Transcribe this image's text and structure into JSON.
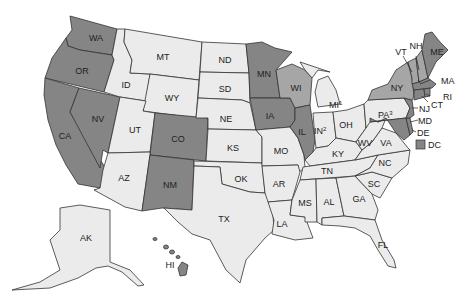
{
  "map": {
    "type": "US states choropleth",
    "colors": {
      "none": "#ebebeb",
      "dark": "#858585",
      "medium": "#a6a6a6",
      "border": "#333333",
      "background": "#ffffff"
    },
    "legend": {
      "dc_label": "DC",
      "dc_category": "dark"
    },
    "states": {
      "WA": {
        "label": "WA",
        "category": "dark"
      },
      "OR": {
        "label": "OR",
        "category": "dark"
      },
      "CA": {
        "label": "CA",
        "category": "dark"
      },
      "NV": {
        "label": "NV",
        "category": "dark"
      },
      "ID": {
        "label": "ID",
        "category": "none"
      },
      "MT": {
        "label": "MT",
        "category": "none"
      },
      "WY": {
        "label": "WY",
        "category": "none"
      },
      "UT": {
        "label": "UT",
        "category": "none"
      },
      "AZ": {
        "label": "AZ",
        "category": "none"
      },
      "CO": {
        "label": "CO",
        "category": "dark"
      },
      "NM": {
        "label": "NM",
        "category": "dark"
      },
      "ND": {
        "label": "ND",
        "category": "none"
      },
      "SD": {
        "label": "SD",
        "category": "none"
      },
      "NE": {
        "label": "NE",
        "category": "none"
      },
      "KS": {
        "label": "KS",
        "category": "none"
      },
      "OK": {
        "label": "OK",
        "category": "none"
      },
      "TX": {
        "label": "TX",
        "category": "none"
      },
      "MN": {
        "label": "MN",
        "category": "dark"
      },
      "IA": {
        "label": "IA",
        "category": "dark"
      },
      "MO": {
        "label": "MO",
        "category": "none"
      },
      "AR": {
        "label": "AR",
        "category": "none"
      },
      "LA": {
        "label": "LA",
        "category": "none"
      },
      "WI": {
        "label": "WI",
        "category": "medium"
      },
      "IL": {
        "label": "IL",
        "category": "dark"
      },
      "MI": {
        "label": "MI",
        "sup": "1",
        "category": "none"
      },
      "IN": {
        "label": "IN",
        "sup": "2",
        "category": "none"
      },
      "OH": {
        "label": "OH",
        "category": "none"
      },
      "KY": {
        "label": "KY",
        "category": "none"
      },
      "TN": {
        "label": "TN",
        "category": "none"
      },
      "MS": {
        "label": "MS",
        "category": "none"
      },
      "AL": {
        "label": "AL",
        "category": "none"
      },
      "GA": {
        "label": "GA",
        "category": "none"
      },
      "FL": {
        "label": "FL",
        "category": "none"
      },
      "SC": {
        "label": "SC",
        "category": "none"
      },
      "NC": {
        "label": "NC",
        "category": "none"
      },
      "VA": {
        "label": "VA",
        "category": "none"
      },
      "WV": {
        "label": "WV",
        "category": "none"
      },
      "PA": {
        "label": "PA",
        "sup": "3",
        "category": "none"
      },
      "NY": {
        "label": "NY",
        "category": "medium"
      },
      "VT": {
        "label": "VT",
        "category": "medium"
      },
      "NH": {
        "label": "NH",
        "category": "medium"
      },
      "ME": {
        "label": "ME",
        "category": "dark"
      },
      "MA": {
        "label": "MA",
        "category": "dark"
      },
      "RI": {
        "label": "RI",
        "category": "dark"
      },
      "CT": {
        "label": "CT",
        "category": "dark"
      },
      "NJ": {
        "label": "NJ",
        "category": "dark"
      },
      "DE": {
        "label": "DE",
        "category": "dark"
      },
      "MD": {
        "label": "MD",
        "category": "dark"
      },
      "AK": {
        "label": "AK",
        "category": "none"
      },
      "HI": {
        "label": "HI",
        "category": "dark"
      }
    }
  }
}
